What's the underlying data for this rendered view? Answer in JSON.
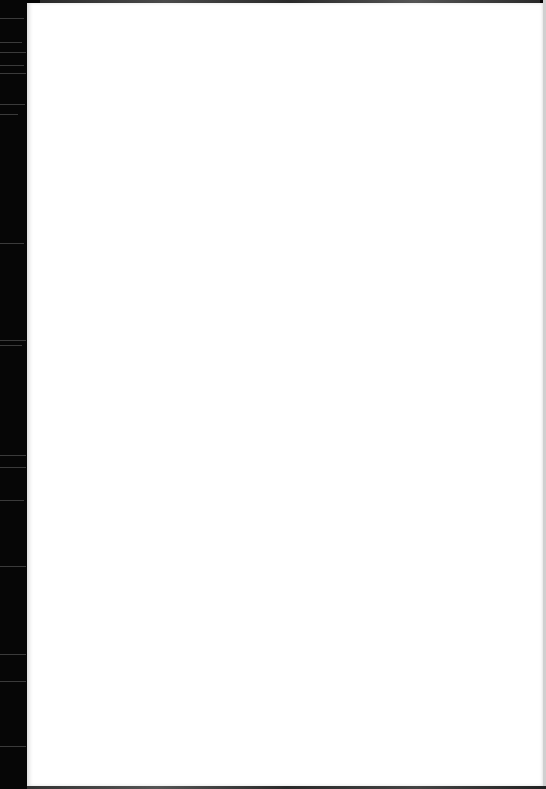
{
  "document": {
    "type": "scanned-page",
    "content": "",
    "page_color": "#ffffff",
    "scanner_bed_color": "#050505",
    "edge_marks": {
      "left_strip_width_px": 27,
      "top_band": true,
      "bottom_band": true
    }
  }
}
